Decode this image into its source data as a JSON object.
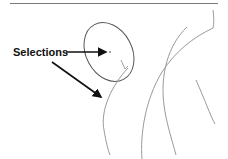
{
  "figure": {
    "annotation": {
      "label": "Selections",
      "arrow_count": 2
    },
    "colors": {
      "ellipse": "#555555",
      "arcs": "#9a9a9a",
      "arrows": "#111111",
      "rule": "#7a7a7a"
    }
  }
}
